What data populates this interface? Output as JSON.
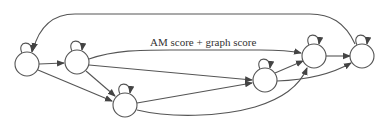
{
  "diagram": {
    "type": "directed-graph",
    "edge_label": "AM score + graph score",
    "colors": {
      "stroke": "#555555",
      "node_fill": "#ffffff",
      "text": "#333333"
    },
    "nodes": [
      {
        "id": "n1",
        "label": "",
        "self_loop": true
      },
      {
        "id": "n2",
        "label": "",
        "self_loop": true
      },
      {
        "id": "n3",
        "label": "",
        "self_loop": true
      },
      {
        "id": "n4",
        "label": "",
        "self_loop": true
      },
      {
        "id": "n5",
        "label": "",
        "self_loop": true
      },
      {
        "id": "n6",
        "label": "",
        "self_loop": true
      }
    ],
    "edges": [
      {
        "from": "n1",
        "to": "n2"
      },
      {
        "from": "n1",
        "to": "n3"
      },
      {
        "from": "n2",
        "to": "n3"
      },
      {
        "from": "n2",
        "to": "n5",
        "label": "AM score + graph score"
      },
      {
        "from": "n2",
        "to": "n4"
      },
      {
        "from": "n3",
        "to": "n4"
      },
      {
        "from": "n3",
        "to": "n5"
      },
      {
        "from": "n4",
        "to": "n5"
      },
      {
        "from": "n4",
        "to": "n6"
      },
      {
        "from": "n5",
        "to": "n6"
      },
      {
        "from": "n6",
        "to": "n1"
      }
    ]
  }
}
